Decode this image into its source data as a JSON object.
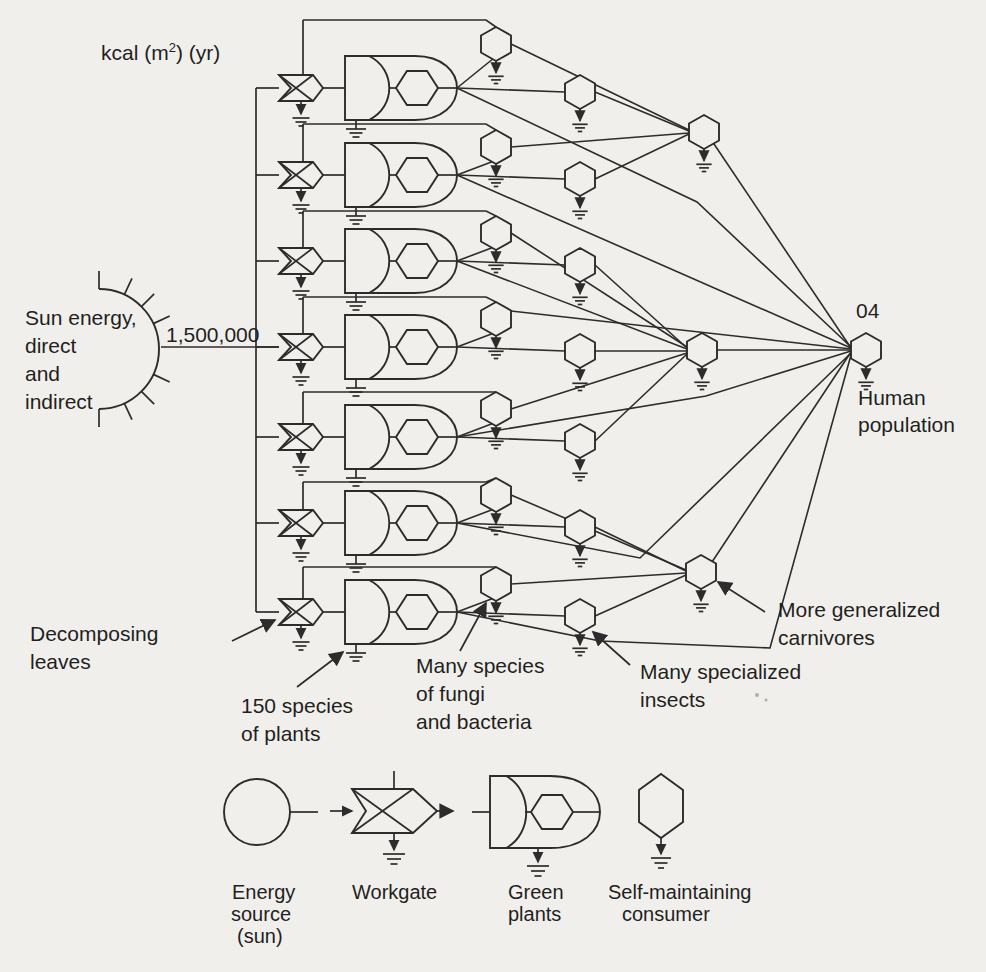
{
  "figure": {
    "paper_color": "#f1efeb",
    "ink_color": "#2c2c2c",
    "unit_note": {
      "pre": "kcal (m",
      "sup": "2",
      "post": ") (yr)"
    },
    "energy_source": {
      "label_lines": [
        "Sun energy,",
        "direct",
        "and",
        "indirect"
      ],
      "flow_value": "1,500,000"
    },
    "labels": {
      "decomposing": {
        "lines": [
          "Decomposing",
          "leaves"
        ]
      },
      "plants": {
        "lines": [
          "150 species",
          "of plants"
        ]
      },
      "fungi": {
        "lines": [
          "Many species",
          "of fungi",
          "and bacteria"
        ]
      },
      "insects": {
        "lines": [
          "Many specialized",
          "insects"
        ]
      },
      "carnivores": {
        "lines": [
          "More generalized",
          "carnivores"
        ]
      },
      "human_tag": "04",
      "human": {
        "lines": [
          "Human",
          "population"
        ]
      }
    },
    "diagram": {
      "row_ys": [
        88,
        175,
        261,
        347,
        437,
        523,
        612
      ],
      "decomp_line_ys": [
        20,
        124,
        211,
        297,
        392,
        482,
        567
      ],
      "bus_x": 256,
      "feeder_x": 303,
      "plant_tip_x": 457,
      "fungi_x": 496,
      "fungi_cys": [
        44,
        147,
        233,
        319,
        409,
        495,
        584
      ],
      "insect_x": 580,
      "insect_cys": [
        92,
        179,
        265,
        351,
        441,
        527,
        616
      ],
      "carnivores": [
        {
          "cx": 704,
          "cy": 132
        },
        {
          "cx": 702,
          "cy": 350
        },
        {
          "cx": 701,
          "cy": 572
        }
      ],
      "human": {
        "cx": 866,
        "cy": 350
      },
      "sun": {
        "cx": 99,
        "cy": 349,
        "r": 60
      },
      "web_edges": [
        {
          "name": "fungi-1-to-carnivore-1",
          "pts": [
            [
              511,
              44
            ],
            [
              689,
              130
            ]
          ]
        },
        {
          "name": "insect-1-to-carnivore-1",
          "pts": [
            [
              595,
              92
            ],
            [
              689,
              131
            ]
          ]
        },
        {
          "name": "fungi-2-to-carnivore-1",
          "pts": [
            [
              511,
              147
            ],
            [
              689,
              133
            ]
          ]
        },
        {
          "name": "insect-2-to-carnivore-1",
          "pts": [
            [
              595,
              179
            ],
            [
              689,
              134
            ]
          ]
        },
        {
          "name": "fungi-3-to-carnivore-2",
          "pts": [
            [
              511,
              233
            ],
            [
              687,
              347
            ]
          ]
        },
        {
          "name": "insect-3-to-carnivore-2",
          "pts": [
            [
              595,
              265
            ],
            [
              687,
              348
            ]
          ]
        },
        {
          "name": "plant-3-to-carnivore-2",
          "pts": [
            [
              457,
              261
            ],
            [
              687,
              349
            ]
          ]
        },
        {
          "name": "insect-4-to-carnivore-2",
          "pts": [
            [
              595,
              351
            ],
            [
              687,
              351
            ]
          ]
        },
        {
          "name": "fungi-5-to-carnivore-2",
          "pts": [
            [
              511,
              409
            ],
            [
              687,
              353
            ]
          ]
        },
        {
          "name": "insect-5-to-carnivore-2",
          "pts": [
            [
              595,
              441
            ],
            [
              687,
              354
            ]
          ]
        },
        {
          "name": "fungi-6-to-carnivore-3",
          "pts": [
            [
              511,
              495
            ],
            [
              686,
              570
            ]
          ]
        },
        {
          "name": "insect-6-to-carnivore-3",
          "pts": [
            [
              595,
              527
            ],
            [
              686,
              571
            ]
          ]
        },
        {
          "name": "fungi-7-to-carnivore-3",
          "pts": [
            [
              511,
              584
            ],
            [
              686,
              573
            ]
          ]
        },
        {
          "name": "insect-7-to-carnivore-3",
          "pts": [
            [
              595,
              616
            ],
            [
              686,
              575
            ]
          ]
        },
        {
          "name": "carnivore-1-to-human",
          "pts": [
            [
              712,
              141
            ],
            [
              851,
              348
            ]
          ]
        },
        {
          "name": "carnivore-2-to-human",
          "pts": [
            [
              717,
              350
            ],
            [
              851,
              350
            ]
          ]
        },
        {
          "name": "carnivore-3-to-human",
          "pts": [
            [
              712,
              562
            ],
            [
              851,
              352
            ]
          ]
        },
        {
          "name": "plant-1-to-human",
          "pts": [
            [
              457,
              88
            ],
            [
              697,
              202
            ],
            [
              851,
              347
            ]
          ]
        },
        {
          "name": "plant-2-to-human",
          "pts": [
            [
              457,
              175
            ],
            [
              851,
              348
            ]
          ]
        },
        {
          "name": "fungi-4-to-human",
          "pts": [
            [
              511,
              311
            ],
            [
              851,
              349
            ]
          ]
        },
        {
          "name": "plant-5-to-human",
          "pts": [
            [
              457,
              437
            ],
            [
              706,
              396
            ],
            [
              851,
              351
            ]
          ]
        },
        {
          "name": "plant-6-to-human",
          "pts": [
            [
              457,
              523
            ],
            [
              640,
              558
            ],
            [
              851,
              353
            ]
          ]
        },
        {
          "name": "plant-7-to-human",
          "pts": [
            [
              457,
              612
            ],
            [
              600,
              641
            ],
            [
              770,
              648
            ],
            [
              851,
              355
            ]
          ]
        }
      ],
      "label_arrows": [
        {
          "name": "decomposing-leaves-arrow",
          "pts": [
            [
              232,
              641
            ],
            [
              275,
              620
            ]
          ]
        },
        {
          "name": "species-of-plants-arrow",
          "pts": [
            [
              297,
              687
            ],
            [
              343,
              652
            ]
          ]
        },
        {
          "name": "fungi-bacteria-arrow",
          "pts": [
            [
              460,
              651
            ],
            [
              486,
              603
            ]
          ]
        },
        {
          "name": "specialized-insects-arrow",
          "pts": [
            [
              630,
              665
            ],
            [
              593,
              632
            ]
          ]
        },
        {
          "name": "generalized-carnivores-arrow",
          "pts": [
            [
              765,
              612
            ],
            [
              718,
              582
            ]
          ]
        }
      ]
    },
    "legend": {
      "items": [
        {
          "id": "energy-source",
          "lines": [
            "Energy",
            "source",
            "(sun)"
          ]
        },
        {
          "id": "workgate",
          "lines": [
            "Workgate"
          ]
        },
        {
          "id": "green-plants",
          "lines": [
            "Green",
            "plants"
          ]
        },
        {
          "id": "self-maintaining-consumer",
          "lines": [
            "Self-maintaining",
            "consumer"
          ]
        }
      ]
    }
  }
}
